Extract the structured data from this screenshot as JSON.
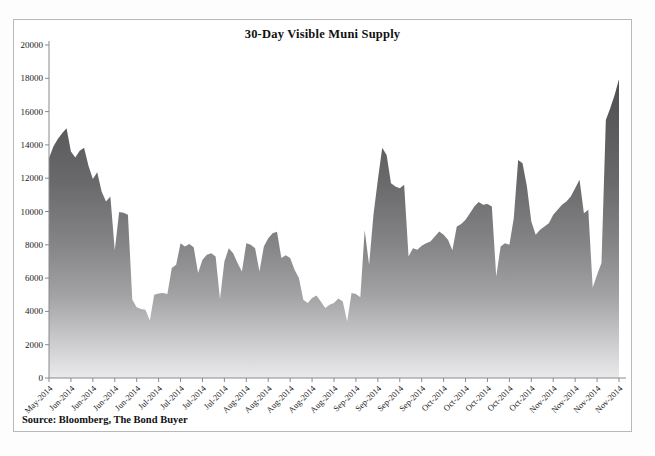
{
  "figure": {
    "title": "30-Day Visible Muni Supply",
    "source": "Source: Bloomberg, The Bond Buyer"
  },
  "chart_data": {
    "type": "area",
    "title": "30-Day Visible Muni Supply",
    "xlabel": "",
    "ylabel": "",
    "ylim": [
      0,
      20000
    ],
    "ytick_step": 2000,
    "grid": false,
    "legend": "none",
    "tick_every": 5,
    "x_tick_labels": [
      "May-2014",
      "Jun-2014",
      "Jun-2014",
      "Jun-2014",
      "Jun-2014",
      "Jul-2014",
      "Jul-2014",
      "Jul-2014",
      "Jul-2014",
      "Aug-2014",
      "Aug-2014",
      "Aug-2014",
      "Aug-2014",
      "Aug-2014",
      "Sep-2014",
      "Sep-2014",
      "Sep-2014",
      "Sep-2014",
      "Oct-2014",
      "Oct-2014",
      "Oct-2014",
      "Oct-2014",
      "Oct-2014",
      "Nov-2014",
      "Nov-2014",
      "Nov-2014",
      "Nov-2014"
    ],
    "values": [
      13200,
      13900,
      14350,
      14700,
      15000,
      13600,
      13250,
      13650,
      13830,
      12750,
      11950,
      12350,
      11200,
      10600,
      10900,
      7670,
      9970,
      9930,
      9800,
      4700,
      4250,
      4150,
      4100,
      3450,
      5000,
      5080,
      5100,
      5050,
      6600,
      6800,
      8090,
      7900,
      8050,
      7850,
      6300,
      7100,
      7400,
      7490,
      7300,
      4750,
      7000,
      7790,
      7500,
      6900,
      6400,
      8100,
      8000,
      7800,
      6400,
      7900,
      8400,
      8700,
      8780,
      7200,
      7370,
      7200,
      6500,
      6000,
      4700,
      4500,
      4800,
      4950,
      4600,
      4200,
      4400,
      4500,
      4770,
      4600,
      3400,
      5100,
      5050,
      4850,
      8880,
      6800,
      9800,
      11900,
      13830,
      13400,
      11700,
      11500,
      11400,
      11600,
      7300,
      7790,
      7700,
      7950,
      8100,
      8200,
      8500,
      8800,
      8600,
      8300,
      7670,
      9100,
      9250,
      9500,
      9900,
      10300,
      10570,
      10400,
      10450,
      10300,
      6100,
      7900,
      8100,
      8000,
      9600,
      13100,
      12900,
      11500,
      9400,
      8600,
      8900,
      9100,
      9300,
      9800,
      10100,
      10400,
      10600,
      10900,
      11400,
      11900,
      9900,
      10100,
      5440,
      6200,
      6900,
      15500,
      16200,
      17000,
      17950
    ],
    "gradient_stops": [
      [
        0.0,
        "#48484a"
      ],
      [
        0.15,
        "#525254"
      ],
      [
        0.4,
        "#68686a"
      ],
      [
        0.6,
        "#858587"
      ],
      [
        0.75,
        "#a2a2a4"
      ],
      [
        0.88,
        "#c8c8ca"
      ],
      [
        1.0,
        "#eaeaec"
      ]
    ],
    "axis_color": "#8a8a8a",
    "label_color": "#1a1a1a"
  }
}
